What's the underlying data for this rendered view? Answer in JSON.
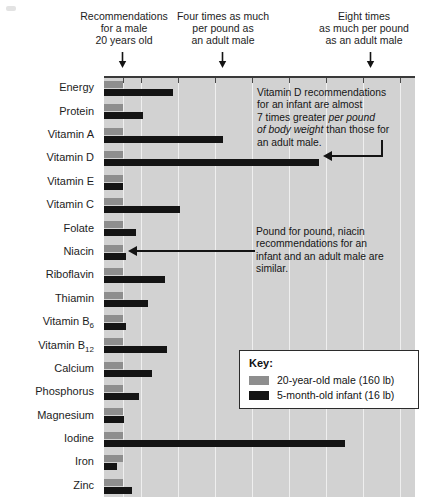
{
  "annotations": {
    "top": [
      {
        "name": "baseline-note",
        "text": "Recommendations\nfor a male\n20 years old"
      },
      {
        "name": "four-times-note",
        "text": "Four times as much\nper pound as\nan adult male"
      },
      {
        "name": "eight-times-note",
        "text": "Eight times\nas much per pound\nas an adult male"
      }
    ],
    "vitamin_d": {
      "line1": "Vitamin D recommendations",
      "line2": "for an infant are almost",
      "line3_plain": "7 times greater ",
      "line3_italic": "per pound",
      "line4_italic": "of body weight",
      "line4_plain": " than those for",
      "line5": "an adult male."
    },
    "niacin": {
      "line1": "Pound for pound, niacin",
      "line2": "recommendations for an",
      "line3": "infant and an adult male are",
      "line4": "similar."
    }
  },
  "legend": {
    "title": "Key:",
    "items": [
      {
        "label": "20-year-old male (160 lb)",
        "color": "#8e8e8e"
      },
      {
        "label": "5-month-old infant (16 lb)",
        "color": "#141414"
      }
    ]
  },
  "chart_data": {
    "type": "bar",
    "orientation": "horizontal",
    "title": "",
    "xlabel": "Multiples of adult-male recommendation per pound of body weight",
    "ylabel": "",
    "xlim": [
      0,
      16.8
    ],
    "grid": true,
    "gridlines": [
      1,
      2,
      4,
      6,
      8,
      10,
      12,
      14,
      16
    ],
    "axis_reference_marks": [
      {
        "value": 1,
        "label": "Recommendations for a male 20 years old"
      },
      {
        "value": 4,
        "label": "Four times as much per pound as an adult male"
      },
      {
        "value": 8,
        "label": "Eight times as much per pound as an adult male"
      }
    ],
    "categories": [
      "Energy",
      "Protein",
      "Vitamin A",
      "Vitamin D",
      "Vitamin E",
      "Vitamin C",
      "Folate",
      "Niacin",
      "Riboflavin",
      "Thiamin",
      "Vitamin B6",
      "Vitamin B12",
      "Calcium",
      "Phosphorus",
      "Magnesium",
      "Iodine",
      "Iron",
      "Zinc"
    ],
    "category_labels_html": [
      "Energy",
      "Protein",
      "Vitamin A",
      "Vitamin D",
      "Vitamin E",
      "Vitamin C",
      "Folate",
      "Niacin",
      "Riboflavin",
      "Thiamin",
      "Vitamin B<sub>6</sub>",
      "Vitamin B<sub>12</sub>",
      "Calcium",
      "Phosphorus",
      "Magnesium",
      "Iodine",
      "Iron",
      "Zinc"
    ],
    "series": [
      {
        "name": "20-year-old male (160 lb)",
        "color": "#8e8e8e",
        "values": [
          1,
          1,
          1,
          1,
          1,
          1,
          1,
          1,
          1,
          1,
          1,
          1,
          1,
          1,
          1,
          1,
          1,
          1
        ]
      },
      {
        "name": "5-month-old infant (16 lb)",
        "color": "#141414",
        "values": [
          3.7,
          2.1,
          6.4,
          11.6,
          1.0,
          4.1,
          1.7,
          1.2,
          3.3,
          2.4,
          1.2,
          3.4,
          2.6,
          1.9,
          1.1,
          13.0,
          0.7,
          1.5
        ]
      }
    ]
  }
}
